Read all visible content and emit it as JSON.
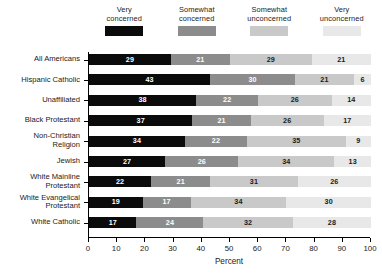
{
  "chart_data": {
    "type": "bar",
    "orientation": "horizontal",
    "stacked": true,
    "title": "",
    "xlabel": "Percent",
    "ylabel": "",
    "xlim": [
      0,
      100
    ],
    "xticks": [
      0,
      10,
      20,
      30,
      40,
      50,
      60,
      70,
      80,
      90,
      100
    ],
    "grid": false,
    "legend_position": "top",
    "categories": [
      "All Americans",
      "Hispanic Catholic",
      "Unaffiliated",
      "Black Protestant",
      "Non-Christian\nReligion",
      "Jewish",
      "White Mainline\nProtestant",
      "White Evangelical\nProtestant",
      "White Catholic"
    ],
    "series": [
      {
        "name": "Very\nconcerned",
        "color": "#0b0b0b",
        "label_color": "#ffffff",
        "values": [
          29,
          43,
          38,
          37,
          34,
          27,
          22,
          19,
          17
        ]
      },
      {
        "name": "Somewhat\nconcerned",
        "color": "#8c8c8c",
        "label_color": "#ffffff",
        "values": [
          21,
          30,
          22,
          21,
          22,
          26,
          21,
          17,
          24
        ]
      },
      {
        "name": "Somewhat\nunconcerned",
        "color": "#c9c9c9",
        "label_color": "#1a1a1a",
        "values": [
          29,
          21,
          26,
          26,
          35,
          34,
          31,
          34,
          32
        ]
      },
      {
        "name": "Very\nunconcerned",
        "color": "#e8e8e8",
        "label_color": "#1a1a1a",
        "values": [
          21,
          6,
          14,
          17,
          9,
          13,
          26,
          30,
          28
        ]
      }
    ]
  }
}
